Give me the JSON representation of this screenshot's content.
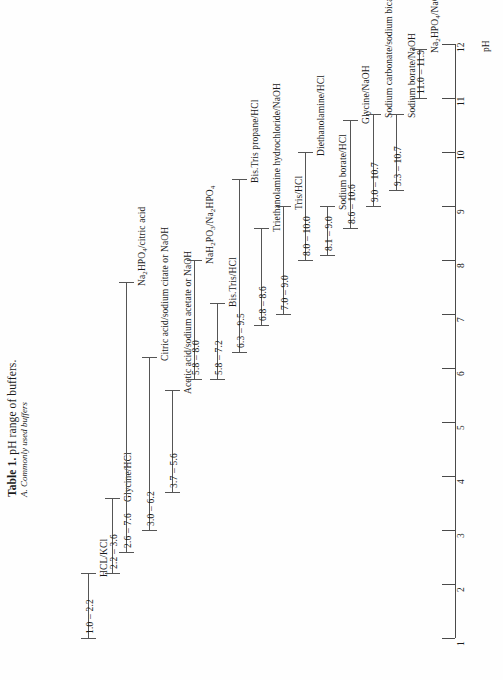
{
  "caption": {
    "table_label": "Table 1.",
    "title": " pH range of buffers.",
    "subtitle": "A. Commonly used buffers"
  },
  "axis": {
    "label": "pH",
    "ticks": [
      "1",
      "2",
      "3",
      "4",
      "5",
      "6",
      "7",
      "8",
      "9",
      "10",
      "11",
      "12"
    ],
    "min": 1,
    "max": 12,
    "line_color": "#4a4a4a"
  },
  "chart_data": {
    "type": "bar",
    "title": "Table 1. pH range of buffers.",
    "subtitle": "A. Commonly used buffers",
    "xlabel": "",
    "ylabel": "pH",
    "ylim": [
      1,
      12
    ],
    "grid": false,
    "legend": "none",
    "orientation": "vertical-range-bars",
    "categories": [
      "HCL/KCl",
      "Glycine/HCl",
      "Na2HPO4/citric acid",
      "Citric acid/sodium citate or NaOH",
      "Acetic acid/sodium acetate or NaOH",
      "NaH2PO3/Na2HPO4",
      "Bis.Tris/HCl",
      "Bis.Tris propane/HCl",
      "Triethanolamine hydrochloride/NaOH",
      "Tris/HCl",
      "Diethanolamine/HCl",
      "Sodium borate/HCl",
      "Glycine/NaOH",
      "Sodium carbonate/sodium bicarbonate",
      "Sodium borate/NaOH",
      "Na2HPO4/NaOH"
    ],
    "ranges": [
      [
        1.0,
        2.2
      ],
      [
        2.2,
        3.6
      ],
      [
        2.6,
        7.6
      ],
      [
        3.0,
        6.2
      ],
      [
        3.7,
        5.6
      ],
      [
        5.8,
        8.0
      ],
      [
        5.8,
        7.2
      ],
      [
        6.3,
        9.5
      ],
      [
        6.8,
        8.6
      ],
      [
        7.0,
        9.0
      ],
      [
        8.0,
        10.0
      ],
      [
        8.1,
        9.0
      ],
      [
        8.6,
        10.6
      ],
      [
        9.0,
        10.7
      ],
      [
        9.3,
        10.7
      ],
      [
        11.0,
        11.9
      ]
    ]
  },
  "buffers": [
    {
      "name": "HCL/KCl",
      "name_html": "HCL/KCl",
      "range": "1.0 &ndash; 2.2",
      "low": 1.0,
      "high": 2.2,
      "x": 88
    },
    {
      "name": "Glycine/HCl",
      "name_html": "Glycine/HCl",
      "range": "2.2 &ndash; 3.6",
      "low": 2.2,
      "high": 3.6,
      "x": 112
    },
    {
      "name": "Na2HPO4/citric acid",
      "name_html": "Na<sub>2</sub>HPO<sub>4</sub>/citric acid",
      "range": "2.6 &ndash; 7.6",
      "low": 2.6,
      "high": 7.6,
      "x": 126
    },
    {
      "name": "Citric acid/sodium citate or NaOH",
      "name_html": "Citric acid/sodium citate or NaOH",
      "range": "3.0 &ndash; 6.2",
      "low": 3.0,
      "high": 6.2,
      "x": 149
    },
    {
      "name": "Acetic acid/sodium acetate or NaOH",
      "name_html": "Acetic acid/sodium acetate or NaOH",
      "range": "3.7 &ndash; 5.6",
      "low": 3.7,
      "high": 5.6,
      "x": 172
    },
    {
      "name": "NaH2PO3/Na2HPO4",
      "name_html": "NaH<sub>2</sub>PO<sub>3</sub>/Na<sub>2</sub>HPO<sub>4</sub>",
      "range": "5.8 &ndash; 8.0",
      "low": 5.8,
      "high": 8.0,
      "x": 194
    },
    {
      "name": "Bis.Tris/HCl",
      "name_html": "Bis.Tris/HCl",
      "range": "5.8 &ndash; 7.2",
      "low": 5.8,
      "high": 7.2,
      "x": 217
    },
    {
      "name": "Bis.Tris propane/HCl",
      "name_html": "Bis.Tris propane/HCl",
      "range": "6.3 &ndash; 9.5",
      "low": 6.3,
      "high": 9.5,
      "x": 239
    },
    {
      "name": "Triethanolamine hydrochloride/NaOH",
      "name_html": "Triethanolamine hydrochloride/NaOH",
      "range": "6.8 &ndash; 8.6",
      "low": 6.8,
      "high": 8.6,
      "x": 261
    },
    {
      "name": "Tris/HCl",
      "name_html": "Tris/HCl",
      "range": "7.0 &ndash; 9.0",
      "low": 7.0,
      "high": 9.0,
      "x": 283
    },
    {
      "name": "Diethanolamine/HCl",
      "name_html": "Diethanolamine/HCl",
      "range": "8.0 &ndash; 10.0",
      "low": 8.0,
      "high": 10.0,
      "x": 305
    },
    {
      "name": "Sodium borate/HCl",
      "name_html": "Sodium borate/HCl",
      "range": "8.1 &ndash; 9.0",
      "low": 8.1,
      "high": 9.0,
      "x": 327
    },
    {
      "name": "Glycine/NaOH",
      "name_html": "Glycine/NaOH",
      "range": "8.6 &ndash; 10.6",
      "low": 8.6,
      "high": 10.6,
      "x": 350
    },
    {
      "name": "Sodium carbonate/sodium bicarbonate",
      "name_html": "Sodium carbonate/sodium bicarbonate",
      "range": "9.0 &ndash; 10.7",
      "low": 9.0,
      "high": 10.7,
      "x": 373
    },
    {
      "name": "Sodium borate/NaOH",
      "name_html": "Sodium borate/NaOH",
      "range": "9.3 &ndash; 10.7",
      "low": 9.3,
      "high": 10.7,
      "x": 396
    },
    {
      "name": "Na2HPO4/NaOH",
      "name_html": "Na<sub>2</sub>HPO<sub>4</sub>/NaOH",
      "range": "11.0 &ndash; 11.9",
      "low": 11.0,
      "high": 11.9,
      "x": 419
    }
  ]
}
